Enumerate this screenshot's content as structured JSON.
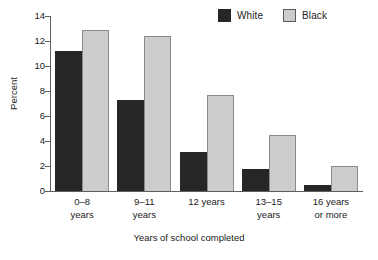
{
  "chart_data": {
    "type": "bar",
    "title": "",
    "xlabel": "Years of school completed",
    "ylabel": "Percent",
    "categories": [
      "0–8 years",
      "9–11 years",
      "12 years",
      "13–15 years",
      "16 years or more"
    ],
    "category_lines": [
      [
        "0–8",
        "years"
      ],
      [
        "9–11",
        "years"
      ],
      [
        "12 years",
        ""
      ],
      [
        "13–15",
        "years"
      ],
      [
        "16 years",
        "or more"
      ]
    ],
    "series": [
      {
        "name": "White",
        "color": "#262626",
        "values": [
          11.2,
          7.3,
          3.1,
          1.8,
          0.5
        ]
      },
      {
        "name": "Black",
        "color": "#cdcdcd",
        "values": [
          12.9,
          12.4,
          7.7,
          4.5,
          2.0
        ]
      }
    ],
    "ylim": [
      0,
      14
    ],
    "yticks": [
      0,
      2,
      4,
      6,
      8,
      10,
      12,
      14
    ],
    "ytick_labels": [
      "0",
      "2",
      "4",
      "6",
      "8",
      "10",
      "12",
      "14"
    ],
    "grid": false,
    "legend_position": "top-right"
  },
  "legend": {
    "entries": [
      {
        "label": "White",
        "color": "#262626"
      },
      {
        "label": "Black",
        "color": "#cdcdcd"
      }
    ]
  },
  "axes": {
    "y_title": "Percent",
    "x_title": "Years of school completed"
  }
}
